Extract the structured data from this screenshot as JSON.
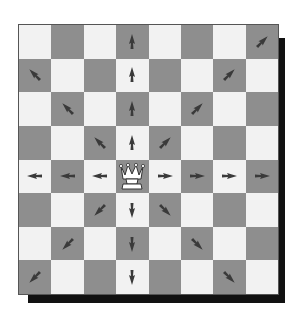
{
  "diagram": {
    "board": {
      "rows": 8,
      "cols": 8,
      "top_left_color": "light",
      "colors": {
        "light": "#f2f2f2",
        "dark": "#8e8e8e",
        "arrow": "#3a3a3a",
        "shadow": "#111111"
      }
    },
    "piece": {
      "type": "queen",
      "color": "white",
      "row": 4,
      "col": 3
    },
    "arrows": [
      {
        "row": 0,
        "col": 3,
        "dir": "N"
      },
      {
        "row": 0,
        "col": 7,
        "dir": "NE"
      },
      {
        "row": 1,
        "col": 0,
        "dir": "NW"
      },
      {
        "row": 1,
        "col": 3,
        "dir": "N"
      },
      {
        "row": 1,
        "col": 6,
        "dir": "NE"
      },
      {
        "row": 2,
        "col": 1,
        "dir": "NW"
      },
      {
        "row": 2,
        "col": 3,
        "dir": "N"
      },
      {
        "row": 2,
        "col": 5,
        "dir": "NE"
      },
      {
        "row": 3,
        "col": 2,
        "dir": "NW"
      },
      {
        "row": 3,
        "col": 3,
        "dir": "N"
      },
      {
        "row": 3,
        "col": 4,
        "dir": "NE"
      },
      {
        "row": 4,
        "col": 0,
        "dir": "W"
      },
      {
        "row": 4,
        "col": 1,
        "dir": "W"
      },
      {
        "row": 4,
        "col": 2,
        "dir": "W"
      },
      {
        "row": 4,
        "col": 4,
        "dir": "E"
      },
      {
        "row": 4,
        "col": 5,
        "dir": "E"
      },
      {
        "row": 4,
        "col": 6,
        "dir": "E"
      },
      {
        "row": 4,
        "col": 7,
        "dir": "E"
      },
      {
        "row": 5,
        "col": 2,
        "dir": "SW"
      },
      {
        "row": 5,
        "col": 3,
        "dir": "S"
      },
      {
        "row": 5,
        "col": 4,
        "dir": "SE"
      },
      {
        "row": 6,
        "col": 1,
        "dir": "SW"
      },
      {
        "row": 6,
        "col": 3,
        "dir": "S"
      },
      {
        "row": 6,
        "col": 5,
        "dir": "SE"
      },
      {
        "row": 7,
        "col": 0,
        "dir": "SW"
      },
      {
        "row": 7,
        "col": 3,
        "dir": "S"
      },
      {
        "row": 7,
        "col": 6,
        "dir": "SE"
      }
    ]
  }
}
